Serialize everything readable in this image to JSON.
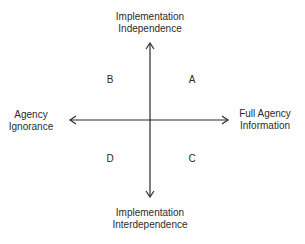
{
  "diagram": {
    "axes": {
      "top": [
        "Implementation",
        "Independence"
      ],
      "bottom": [
        "Implementation",
        "Interdependence"
      ],
      "left": [
        "Agency",
        "Ignorance"
      ],
      "right": [
        "Full Agency",
        "Information"
      ]
    },
    "quadrants": {
      "top_left": "B",
      "top_right": "A",
      "bottom_left": "D",
      "bottom_right": "C"
    },
    "colors": {
      "line": "#2b2b2b",
      "text": "#2b2b2b"
    }
  }
}
